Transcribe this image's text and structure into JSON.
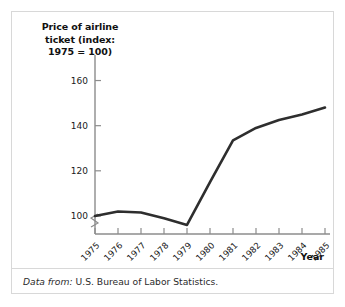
{
  "figure": {
    "y_axis_title_lines": [
      "Price of airline",
      "ticket (index:",
      "1975 = 100)"
    ],
    "x_axis_title": "Year",
    "source_lead": "Data from:",
    "source_text": "U.S. Bureau of Labor Statistics.",
    "axis_break_icon": "axis-break-zigzag-icon",
    "line_color": "#2e2e2e",
    "axis_color": "#8c8c8c",
    "panel_border_color": "#d8d8d8",
    "text_color": "#1a1a1a"
  },
  "chart_data": {
    "type": "line",
    "title": "",
    "xlabel": "Year",
    "ylabel": "Price of airline ticket (index: 1975 = 100)",
    "categories": [
      "1975",
      "1976",
      "1977",
      "1978",
      "1979",
      "1980",
      "1981",
      "1982",
      "1983",
      "1984",
      "1985"
    ],
    "x": [
      1975,
      1976,
      1977,
      1978,
      1979,
      1980,
      1981,
      1982,
      1983,
      1984,
      1985
    ],
    "values": [
      100,
      102,
      101.5,
      99,
      96,
      115,
      133.5,
      139,
      142.5,
      145,
      148
    ],
    "yticks": [
      100,
      120,
      140,
      160
    ],
    "ylim": [
      92,
      166
    ],
    "xlim": [
      1975,
      1985
    ],
    "grid": false,
    "legend": false,
    "axis_break": true,
    "series": [
      {
        "name": "Price of airline ticket (index: 1975 = 100)",
        "values": [
          100,
          102,
          101.5,
          99,
          96,
          115,
          133.5,
          139,
          142.5,
          145,
          148
        ]
      }
    ]
  }
}
